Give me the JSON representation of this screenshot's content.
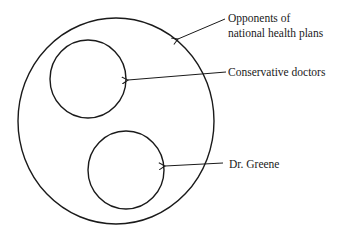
{
  "diagram": {
    "type": "euler",
    "stroke_color": "#1a1a1a",
    "background": "#ffffff",
    "sets": [
      {
        "id": "outer",
        "label_lines": [
          "Opponents of",
          "national health plans"
        ],
        "contains": [
          "conservative-doctors",
          "dr-greene"
        ]
      },
      {
        "id": "conservative-doctors",
        "label_lines": [
          "Conservative doctors"
        ],
        "inside": "outer"
      },
      {
        "id": "dr-greene",
        "label_lines": [
          "Dr. Greene"
        ],
        "inside": "outer",
        "disjoint_from": "conservative-doctors"
      }
    ]
  },
  "labels": {
    "outer_line1": "Opponents of",
    "outer_line2": "national health plans",
    "conservative": "Conservative doctors",
    "greene": "Dr. Greene"
  }
}
